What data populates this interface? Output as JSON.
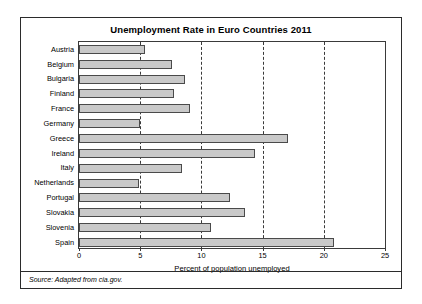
{
  "figure": {
    "title": "Unemployment Rate in Euro Countries 2011",
    "source_note": "Source: Adapted from cia.gov."
  },
  "chart_data": {
    "type": "bar",
    "orientation": "horizontal",
    "title": "Unemployment Rate in Euro Countries 2011",
    "xlabel": "Percent of population unemployed",
    "ylabel": "",
    "xlim": [
      0,
      25
    ],
    "xticks": [
      0,
      5,
      10,
      15,
      20,
      25
    ],
    "xtick_labels": [
      "0",
      "5",
      "10",
      "15",
      "20",
      "25"
    ],
    "grid": "vertical-dashed",
    "legend": "none",
    "bar_color": "#c9c9c9",
    "bar_edge_color": "#4a4a4a",
    "categories": [
      "Austria",
      "Belgium",
      "Bulgaria",
      "Finland",
      "France",
      "Germany",
      "Greece",
      "Ireland",
      "Italy",
      "Netherlands",
      "Portugal",
      "Slovakia",
      "Slovenia",
      "Spain"
    ],
    "values": [
      5.4,
      7.6,
      8.7,
      7.8,
      9.1,
      5.0,
      17.1,
      14.4,
      8.4,
      4.9,
      12.3,
      13.6,
      10.8,
      20.8
    ]
  }
}
